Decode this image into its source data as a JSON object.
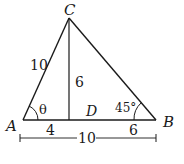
{
  "diagram": {
    "type": "triangle",
    "stroke_color": "#1a1a1a",
    "vertices": {
      "A": {
        "label": "A",
        "x": 23,
        "y": 120
      },
      "B": {
        "label": "B",
        "x": 156,
        "y": 120
      },
      "C": {
        "label": "C",
        "x": 69,
        "y": 18
      },
      "D": {
        "label": "D",
        "x": 69,
        "y": 120
      }
    },
    "labels": {
      "vertex_a": "A",
      "vertex_b": "B",
      "vertex_c": "C",
      "point_d": "D",
      "side_ac": "10",
      "altitude_cd": "6",
      "segment_ad": "4",
      "segment_db": "6",
      "base_ab": "10",
      "angle_a": "θ",
      "angle_b": "45°"
    }
  }
}
